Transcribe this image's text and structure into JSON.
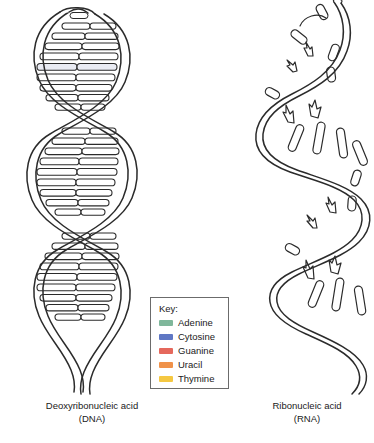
{
  "figure": {
    "background_color": "#ffffff",
    "stroke_color": "#2b2b2b",
    "alt_title": "Structure comparison of DNA and RNA"
  },
  "dna": {
    "caption_line1": "Deoxyribonucleic acid",
    "caption_line2": "(DNA)",
    "structure": "double-helix",
    "rung_count": 34,
    "strand_count": 2,
    "rung_fill": "#ffffff",
    "tint_color": "#c9cfe4"
  },
  "rna": {
    "caption_line1": "Ribonucleic acid",
    "caption_line2": "(RNA)",
    "structure": "single-strand",
    "base_count": 18,
    "strand_count": 1,
    "base_fill": "#ffffff"
  },
  "legend": {
    "title": "Key:",
    "items": [
      {
        "label": "Adenine",
        "color": "#7fb79b"
      },
      {
        "label": "Cytosine",
        "color": "#5f77c4"
      },
      {
        "label": "Guanine",
        "color": "#e5685c"
      },
      {
        "label": "Uracil",
        "color": "#f0924a"
      },
      {
        "label": "Thymine",
        "color": "#f5c842"
      }
    ],
    "border_color": "#6b6b6b"
  }
}
